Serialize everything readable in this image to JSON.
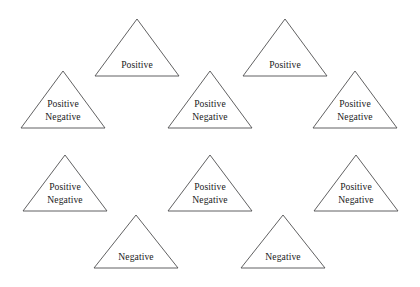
{
  "figure": {
    "type": "triangle-lattice-diagram",
    "background_color": "#ffffff",
    "stroke_color": "#4f4f50",
    "text_color": "#1b1b1b",
    "width": 420,
    "height": 287,
    "triangle_count": 11,
    "labels_vocabulary": [
      "Positive",
      "Negative"
    ],
    "triangles": [
      {
        "id": "tri-row-a-1",
        "row": "A",
        "apex_x": 137,
        "apex_y": 19,
        "base_y": 76,
        "half_width": 42,
        "label_lines": [
          "Positive"
        ],
        "label_text": "Positive"
      },
      {
        "id": "tri-row-a-2",
        "row": "A",
        "apex_x": 285,
        "apex_y": 19,
        "base_y": 76,
        "half_width": 42,
        "label_lines": [
          "Positive"
        ],
        "label_text": "Positive"
      },
      {
        "id": "tri-row-b-1",
        "row": "B",
        "apex_x": 63,
        "apex_y": 71,
        "base_y": 128,
        "half_width": 42,
        "label_lines": [
          "Positive",
          "Negative"
        ],
        "label_text": "Positive Negative"
      },
      {
        "id": "tri-row-b-2",
        "row": "B",
        "apex_x": 210,
        "apex_y": 71,
        "base_y": 128,
        "half_width": 42,
        "label_lines": [
          "Positive",
          "Negative"
        ],
        "label_text": "Positive Negative"
      },
      {
        "id": "tri-row-b-3",
        "row": "B",
        "apex_x": 355,
        "apex_y": 71,
        "base_y": 128,
        "half_width": 42,
        "label_lines": [
          "Positive",
          "Negative"
        ],
        "label_text": "Positive Negative"
      },
      {
        "id": "tri-row-c-1",
        "row": "C",
        "apex_x": 65,
        "apex_y": 155,
        "base_y": 211,
        "half_width": 42,
        "label_lines": [
          "Positive",
          "Negative"
        ],
        "label_text": "Positive Negative"
      },
      {
        "id": "tri-row-c-2",
        "row": "C",
        "apex_x": 210,
        "apex_y": 155,
        "base_y": 211,
        "half_width": 42,
        "label_lines": [
          "Positive",
          "Negative"
        ],
        "label_text": "Positive Negative"
      },
      {
        "id": "tri-row-c-3",
        "row": "C",
        "apex_x": 356,
        "apex_y": 155,
        "base_y": 211,
        "half_width": 42,
        "label_lines": [
          "Positive",
          "Negative"
        ],
        "label_text": "Positive Negative"
      },
      {
        "id": "tri-row-d-1",
        "row": "D",
        "apex_x": 136,
        "apex_y": 215,
        "base_y": 268,
        "half_width": 42,
        "label_lines": [
          "Negative"
        ],
        "label_text": "Negative"
      },
      {
        "id": "tri-row-d-2",
        "row": "D",
        "apex_x": 283,
        "apex_y": 215,
        "base_y": 268,
        "half_width": 42,
        "label_lines": [
          "Negative"
        ],
        "label_text": "Negative"
      }
    ]
  }
}
